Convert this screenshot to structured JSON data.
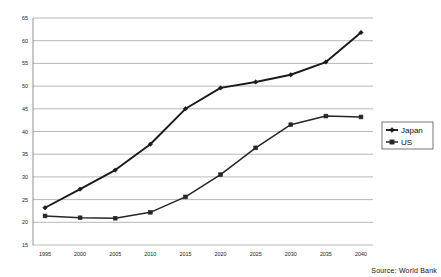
{
  "chart_data": {
    "type": "line",
    "title": "",
    "xlabel": "",
    "ylabel": "",
    "categories": [
      "1995",
      "2000",
      "2005",
      "2010",
      "2015",
      "2020",
      "2025",
      "2030",
      "2035",
      "2040"
    ],
    "series": [
      {
        "name": "Japan",
        "marker": "diamond",
        "color": "#1a1a1a",
        "values": [
          23.2,
          27.3,
          31.5,
          37.2,
          45.0,
          49.6,
          50.9,
          52.5,
          55.3,
          61.8
        ]
      },
      {
        "name": "US",
        "marker": "square",
        "color": "#262626",
        "values": [
          21.4,
          21.0,
          20.9,
          22.2,
          25.6,
          30.5,
          36.4,
          41.5,
          43.4,
          43.2
        ]
      }
    ],
    "ylim": [
      15,
      65
    ],
    "ytick_step": 5,
    "yticks": [
      "15",
      "20",
      "25",
      "30",
      "35",
      "40",
      "45",
      "50",
      "55",
      "60",
      "65"
    ],
    "grid": "horizontal",
    "legend_position": "right-outside"
  },
  "legend": {
    "entries": [
      {
        "label": "Japan",
        "marker": "diamond"
      },
      {
        "label": "US",
        "marker": "square"
      }
    ]
  },
  "footer": {
    "source": "Source: World Bank"
  },
  "colors": {
    "series_japan": "#1a1a1a",
    "series_us": "#262626",
    "grid": "#9a9a9a",
    "axis": "#6e6e6e",
    "background": "#ffffff",
    "legend_border": "#555555"
  }
}
